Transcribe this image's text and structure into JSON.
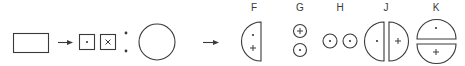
{
  "diagram": {
    "stroke_color": "#3a3a3a",
    "background": "#ffffff",
    "stages": [
      {
        "id": "rectangle",
        "shape": "rectangle"
      },
      {
        "id": "arrow-1",
        "shape": "arrow"
      },
      {
        "id": "squares",
        "shape": "two-squares",
        "symbols": [
          "•",
          "×"
        ]
      },
      {
        "id": "colon-dots",
        "shape": "two-dots"
      },
      {
        "id": "circle",
        "shape": "circle"
      },
      {
        "id": "arrow-2",
        "shape": "arrow"
      }
    ],
    "options": [
      {
        "label": "F",
        "description": "single half-circle with dot and plus",
        "symbols": [
          "•",
          "+"
        ]
      },
      {
        "label": "G",
        "description": "two small stacked circles",
        "symbols": [
          "+",
          "•"
        ]
      },
      {
        "label": "H",
        "description": "two small side-by-side circles",
        "symbols": [
          "•",
          "•"
        ]
      },
      {
        "label": "J",
        "description": "circle split vertically into two halves",
        "symbols": [
          "•",
          "+"
        ]
      },
      {
        "label": "K",
        "description": "circle split horizontally into two halves",
        "symbols": [
          "•",
          "+"
        ]
      }
    ]
  }
}
